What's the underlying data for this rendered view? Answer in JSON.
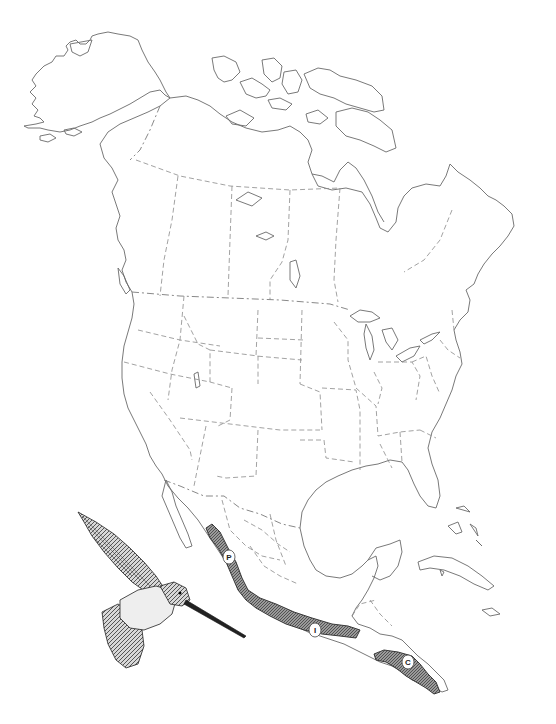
{
  "map": {
    "type": "species range map",
    "region": "North America",
    "background_color": "#ffffff",
    "coastline_color": "#6a6a6a",
    "border_color": "#8a8a8a",
    "range_fill_color": "#7a7a7a",
    "ranges": [
      {
        "id": "P",
        "label": "P",
        "area": "Pacific slope of western Mexico"
      },
      {
        "id": "I",
        "label": "I",
        "area": "Southern Mexico (Guerrero–Oaxaca)"
      },
      {
        "id": "C",
        "label": "C",
        "area": "Central America (Nicaragua–Costa Rica)"
      }
    ]
  },
  "illustration": {
    "subject": "hummingbird",
    "pose": "hovering, wings raised, long bill pointing right"
  }
}
